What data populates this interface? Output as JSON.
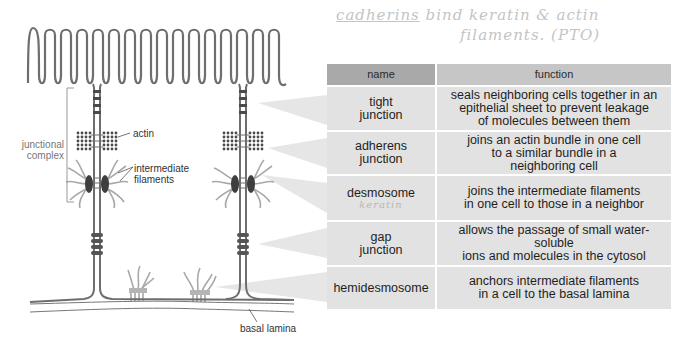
{
  "handwritten_note": {
    "line1_underlined": "cadherins",
    "line1_rest": "bind keratin & actin",
    "line2": "filaments.  (PTO)"
  },
  "diagram_labels": {
    "junctional_complex": [
      "junctional",
      "complex"
    ],
    "actin": "actin",
    "intermediate_filaments": [
      "intermediate",
      "filaments"
    ],
    "basal_lamina": "basal lamina"
  },
  "table": {
    "headers": {
      "name": "name",
      "function": "function"
    },
    "rows": [
      {
        "name": [
          "tight",
          "junction"
        ],
        "function": [
          "seals neighboring cells together in an",
          "epithelial sheet to prevent leakage",
          "of molecules between them"
        ],
        "height": 43
      },
      {
        "name": [
          "adherens",
          "junction"
        ],
        "function": [
          "joins an actin bundle in one cell",
          "to a similar bundle in a",
          "neighboring cell"
        ],
        "height": 42
      },
      {
        "name": [
          "desmosome"
        ],
        "note": "keratin",
        "function": [
          "joins the intermediate filaments",
          "in one cell to those in a neighbor"
        ],
        "height": 44
      },
      {
        "name": [
          "gap",
          "junction"
        ],
        "function": [
          "allows the passage of small water-soluble",
          "ions and molecules in the cytosol"
        ],
        "height": 43
      },
      {
        "name": [
          "hemidesmosome"
        ],
        "function": [
          "anchors intermediate filaments",
          "in a cell to the basal lamina"
        ],
        "height": 42
      }
    ]
  },
  "colors": {
    "header_name_bg": "#a9a9a9",
    "header_function_bg": "#c6c6c6",
    "cell_bg": "#e2e2e2",
    "membrane": "#6e6e6e",
    "junction_dark": "#4a4a4a",
    "filaments": "#a8a8a8",
    "pointer_wedge": "#e6e6e6"
  }
}
